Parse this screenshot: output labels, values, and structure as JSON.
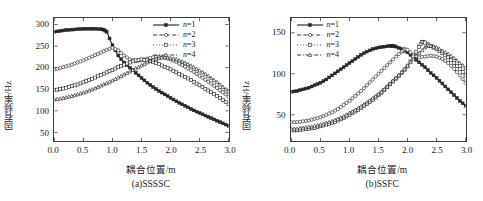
{
  "figure": {
    "panels": [
      {
        "id": "a",
        "caption": "(a)SSSSC",
        "xlabel": "耦合位置/m",
        "ylabel": "固有频率/Hz",
        "xticks": [
          "0.0",
          "0.5",
          "1.0",
          "1.5",
          "2.0",
          "2.5",
          "3.0"
        ],
        "yticks": [
          "50",
          "100",
          "150",
          "200",
          "250",
          "300"
        ],
        "legend": [
          {
            "label": "n=1",
            "style": "solid",
            "marker": "filled-square"
          },
          {
            "label": "n=2",
            "style": "dashed",
            "marker": "circle"
          },
          {
            "label": "n=3",
            "style": "dotted",
            "marker": "open-square"
          },
          {
            "label": "n=4",
            "style": "dashdot",
            "marker": "triangle"
          }
        ]
      },
      {
        "id": "b",
        "caption": "(b)SSFC",
        "xlabel": "耦合位置/m",
        "ylabel": "固有频率/Hz",
        "xticks": [
          "0.0",
          "0.5",
          "1.0",
          "1.5",
          "2.0",
          "2.5",
          "3.0"
        ],
        "yticks": [
          "50",
          "100",
          "150"
        ],
        "legend": [
          {
            "label": "n=1",
            "style": "solid",
            "marker": "filled-square"
          },
          {
            "label": "n=2",
            "style": "dashed",
            "marker": "circle"
          },
          {
            "label": "n=3",
            "style": "dotted",
            "marker": "open-square"
          },
          {
            "label": "n=4",
            "style": "dashdot",
            "marker": "triangle"
          }
        ]
      }
    ]
  },
  "chart_data": [
    {
      "type": "line",
      "panel": "a",
      "title": "(a)SSSSC",
      "xlabel": "耦合位置/m",
      "ylabel": "固有频率/Hz",
      "xlim": [
        0.0,
        3.0
      ],
      "ylim": [
        30,
        315
      ],
      "xticks": [
        0.0,
        0.5,
        1.0,
        1.5,
        2.0,
        2.5,
        3.0
      ],
      "yticks": [
        50,
        100,
        150,
        200,
        250,
        300
      ],
      "grid": false,
      "legend_position": "top-right",
      "series": [
        {
          "name": "n=1",
          "marker": "filled-square",
          "linestyle": "solid",
          "x": [
            0.0,
            0.1,
            0.2,
            0.3,
            0.4,
            0.5,
            0.6,
            0.7,
            0.8,
            0.85,
            0.9,
            1.0,
            1.1,
            1.2,
            1.3,
            1.4,
            1.5,
            1.6,
            1.7,
            1.8,
            1.9,
            2.0,
            2.1,
            2.2,
            2.3,
            2.4,
            2.5,
            2.6,
            2.7,
            2.8,
            2.9,
            3.0
          ],
          "y": [
            283,
            285,
            287,
            288,
            289,
            290,
            290,
            290,
            289,
            288,
            283,
            252,
            228,
            212,
            200,
            188,
            176,
            165,
            155,
            146,
            138,
            130,
            122,
            115,
            108,
            101,
            95,
            89,
            83,
            77,
            71,
            65
          ]
        },
        {
          "name": "n=2",
          "marker": "circle",
          "linestyle": "dashed",
          "x": [
            0.0,
            0.1,
            0.2,
            0.3,
            0.4,
            0.5,
            0.6,
            0.7,
            0.8,
            0.9,
            1.0,
            1.1,
            1.2,
            1.3,
            1.4,
            1.5,
            1.6,
            1.7,
            1.8,
            1.9,
            2.0,
            2.1,
            2.2,
            2.3,
            2.4,
            2.5,
            2.6,
            2.7,
            2.8,
            2.9,
            3.0
          ],
          "y": [
            196,
            199,
            203,
            207,
            212,
            217,
            223,
            229,
            235,
            241,
            246,
            240,
            228,
            219,
            215,
            217,
            221,
            224,
            225,
            223,
            219,
            213,
            206,
            198,
            190,
            181,
            172,
            163,
            153,
            143,
            133
          ]
        },
        {
          "name": "n=3",
          "marker": "open-square",
          "linestyle": "dotted",
          "x": [
            0.0,
            0.1,
            0.2,
            0.3,
            0.4,
            0.5,
            0.6,
            0.7,
            0.8,
            0.9,
            1.0,
            1.1,
            1.2,
            1.3,
            1.4,
            1.5,
            1.6,
            1.7,
            1.8,
            1.9,
            2.0,
            2.1,
            2.2,
            2.3,
            2.4,
            2.5,
            2.6,
            2.7,
            2.8,
            2.9,
            3.0
          ],
          "y": [
            148,
            150,
            153,
            157,
            161,
            166,
            171,
            177,
            183,
            189,
            195,
            201,
            207,
            212,
            217,
            219,
            217,
            213,
            208,
            202,
            196,
            189,
            182,
            175,
            167,
            159,
            151,
            143,
            134,
            125,
            115
          ]
        },
        {
          "name": "n=4",
          "marker": "triangle",
          "linestyle": "dashdot",
          "x": [
            0.0,
            0.1,
            0.2,
            0.3,
            0.4,
            0.5,
            0.6,
            0.7,
            0.8,
            0.9,
            1.0,
            1.1,
            1.2,
            1.3,
            1.4,
            1.5,
            1.6,
            1.7,
            1.8,
            1.9,
            2.0,
            2.1,
            2.2,
            2.3,
            2.4,
            2.5,
            2.6,
            2.7,
            2.8,
            2.9,
            3.0
          ],
          "y": [
            126,
            128,
            131,
            134,
            138,
            142,
            147,
            152,
            158,
            164,
            170,
            177,
            184,
            191,
            198,
            205,
            212,
            218,
            222,
            224,
            222,
            219,
            214,
            208,
            201,
            193,
            185,
            176,
            166,
            155,
            144
          ]
        }
      ]
    },
    {
      "type": "line",
      "panel": "b",
      "title": "(b)SSFC",
      "xlabel": "耦合位置/m",
      "ylabel": "固有频率/Hz",
      "xlim": [
        0.0,
        3.0
      ],
      "ylim": [
        18,
        168
      ],
      "xticks": [
        0.0,
        0.5,
        1.0,
        1.5,
        2.0,
        2.5,
        3.0
      ],
      "yticks": [
        50,
        100,
        150
      ],
      "grid": false,
      "legend_position": "top-left",
      "series": [
        {
          "name": "n=1",
          "marker": "filled-square",
          "linestyle": "solid",
          "x": [
            0.0,
            0.1,
            0.2,
            0.3,
            0.4,
            0.5,
            0.6,
            0.7,
            0.8,
            0.9,
            1.0,
            1.1,
            1.2,
            1.3,
            1.4,
            1.5,
            1.6,
            1.7,
            1.75,
            1.8,
            1.9,
            2.0,
            2.1,
            2.2,
            2.3,
            2.4,
            2.5,
            2.6,
            2.7,
            2.8,
            2.9,
            3.0
          ],
          "y": [
            78,
            79,
            81,
            83,
            86,
            89,
            93,
            98,
            103,
            108,
            113,
            118,
            123,
            127,
            130,
            132,
            133,
            134,
            134,
            133,
            130,
            126,
            120,
            114,
            108,
            101,
            95,
            88,
            81,
            74,
            67,
            61
          ]
        },
        {
          "name": "n=2",
          "marker": "circle",
          "linestyle": "dashed",
          "x": [
            0.0,
            0.1,
            0.2,
            0.3,
            0.4,
            0.5,
            0.6,
            0.7,
            0.8,
            0.9,
            1.0,
            1.1,
            1.2,
            1.3,
            1.4,
            1.5,
            1.6,
            1.7,
            1.8,
            1.9,
            1.95,
            2.0,
            2.1,
            2.2,
            2.3,
            2.4,
            2.5,
            2.6,
            2.7,
            2.8,
            2.9,
            3.0
          ],
          "y": [
            41,
            41,
            42,
            43,
            45,
            47,
            50,
            53,
            57,
            62,
            67,
            73,
            79,
            86,
            93,
            100,
            107,
            114,
            121,
            127,
            130,
            129,
            123,
            120,
            121,
            122,
            121,
            118,
            113,
            106,
            98,
            89
          ]
        },
        {
          "name": "n=3",
          "marker": "open-square",
          "linestyle": "dotted",
          "x": [
            0.0,
            0.1,
            0.2,
            0.3,
            0.4,
            0.5,
            0.6,
            0.7,
            0.8,
            0.9,
            1.0,
            1.1,
            1.2,
            1.3,
            1.4,
            1.5,
            1.6,
            1.7,
            1.8,
            1.9,
            2.0,
            2.1,
            2.2,
            2.25,
            2.3,
            2.4,
            2.5,
            2.6,
            2.7,
            2.8,
            2.9,
            3.0
          ],
          "y": [
            31,
            31,
            32,
            33,
            34,
            36,
            38,
            40,
            43,
            46,
            50,
            54,
            58,
            63,
            68,
            74,
            80,
            87,
            94,
            101,
            109,
            121,
            133,
            139,
            138,
            134,
            130,
            125,
            120,
            113,
            106,
            98
          ]
        },
        {
          "name": "n=4",
          "marker": "triangle",
          "linestyle": "dashdot",
          "x": [
            0.0,
            0.1,
            0.2,
            0.3,
            0.4,
            0.5,
            0.6,
            0.7,
            0.8,
            0.9,
            1.0,
            1.1,
            1.2,
            1.3,
            1.4,
            1.5,
            1.6,
            1.7,
            1.8,
            1.9,
            2.0,
            2.1,
            2.2,
            2.3,
            2.35,
            2.4,
            2.5,
            2.6,
            2.7,
            2.8,
            2.9,
            3.0
          ],
          "y": [
            33,
            33,
            34,
            35,
            36,
            38,
            40,
            42,
            45,
            48,
            52,
            56,
            60,
            65,
            70,
            75,
            81,
            88,
            95,
            102,
            110,
            118,
            125,
            132,
            135,
            134,
            132,
            128,
            124,
            119,
            113,
            107
          ]
        }
      ]
    }
  ]
}
